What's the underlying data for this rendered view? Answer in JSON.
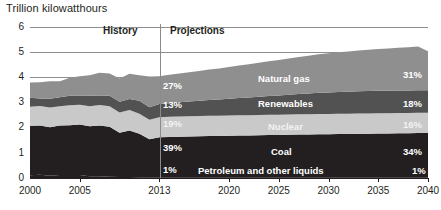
{
  "chart_data": {
    "type": "area",
    "title": "Trillion kilowatthours",
    "xlabel": "",
    "ylabel": "Trillion kilowatthours",
    "ylim": [
      0,
      6
    ],
    "xlim": [
      2000,
      2040
    ],
    "grid": true,
    "stacked": true,
    "legend": "inline-labels",
    "y_ticks": [
      "0",
      "1",
      "2",
      "3",
      "4",
      "5",
      "6"
    ],
    "x_ticks": [
      "2000",
      "2005",
      "2013",
      "2020",
      "2025",
      "2030",
      "2035",
      "2040"
    ],
    "annotations": {
      "history": "History",
      "projections": "Projections",
      "divider_year": "2013"
    },
    "series": [
      {
        "name": "Natural gas",
        "color": "#8f8f8f",
        "share_2013": "27%",
        "share_2040": "31%",
        "values": [
          0.6,
          0.64,
          0.69,
          0.63,
          0.71,
          0.76,
          0.81,
          0.9,
          0.88,
          0.92,
          1.0,
          1.01,
          1.22,
          1.1,
          1.12,
          1.14,
          1.16,
          1.18,
          1.21,
          1.23,
          1.26,
          1.29,
          1.32,
          1.35,
          1.38,
          1.41,
          1.44,
          1.47,
          1.5,
          1.53,
          1.56,
          1.58,
          1.6,
          1.62,
          1.64,
          1.66,
          1.68,
          1.7,
          1.72,
          1.74,
          1.55
        ]
      },
      {
        "name": "Renewables",
        "color": "#525252",
        "share_2013": "13%",
        "share_2040": "18%",
        "values": [
          0.36,
          0.3,
          0.35,
          0.36,
          0.38,
          0.37,
          0.42,
          0.38,
          0.42,
          0.43,
          0.44,
          0.52,
          0.5,
          0.53,
          0.55,
          0.57,
          0.59,
          0.61,
          0.63,
          0.65,
          0.67,
          0.69,
          0.71,
          0.73,
          0.75,
          0.77,
          0.79,
          0.81,
          0.83,
          0.85,
          0.86,
          0.87,
          0.88,
          0.89,
          0.9,
          0.9,
          0.9,
          0.9,
          0.9,
          0.9,
          0.9
        ]
      },
      {
        "name": "Nuclear",
        "color": "#c9c9c9",
        "share_2013": "19%",
        "share_2040": "16%",
        "values": [
          0.75,
          0.77,
          0.78,
          0.76,
          0.79,
          0.78,
          0.79,
          0.81,
          0.81,
          0.8,
          0.81,
          0.79,
          0.77,
          0.79,
          0.8,
          0.8,
          0.8,
          0.8,
          0.8,
          0.8,
          0.8,
          0.8,
          0.8,
          0.8,
          0.8,
          0.8,
          0.8,
          0.8,
          0.8,
          0.8,
          0.8,
          0.8,
          0.8,
          0.8,
          0.8,
          0.8,
          0.8,
          0.8,
          0.8,
          0.8,
          0.8
        ]
      },
      {
        "name": "Coal",
        "color": "#231f20",
        "share_2013": "39%",
        "share_2040": "34%",
        "values": [
          1.97,
          1.96,
          1.93,
          1.97,
          1.98,
          2.01,
          1.99,
          2.02,
          1.99,
          1.76,
          1.85,
          1.73,
          1.51,
          1.59,
          1.6,
          1.61,
          1.62,
          1.63,
          1.64,
          1.64,
          1.65,
          1.66,
          1.66,
          1.67,
          1.68,
          1.68,
          1.69,
          1.7,
          1.7,
          1.71,
          1.71,
          1.72,
          1.72,
          1.73,
          1.73,
          1.74,
          1.74,
          1.75,
          1.75,
          1.76,
          1.76
        ]
      },
      {
        "name": "Petroleum and other liquids",
        "color": "#231f20",
        "share_2013": "1%",
        "share_2040": "1%",
        "values": [
          0.11,
          0.13,
          0.09,
          0.12,
          0.12,
          0.12,
          0.07,
          0.07,
          0.05,
          0.04,
          0.04,
          0.03,
          0.03,
          0.03,
          0.03,
          0.03,
          0.03,
          0.03,
          0.03,
          0.03,
          0.03,
          0.03,
          0.03,
          0.03,
          0.03,
          0.03,
          0.03,
          0.03,
          0.03,
          0.03,
          0.03,
          0.03,
          0.03,
          0.03,
          0.03,
          0.03,
          0.03,
          0.03,
          0.03,
          0.03,
          0.03
        ]
      }
    ]
  }
}
